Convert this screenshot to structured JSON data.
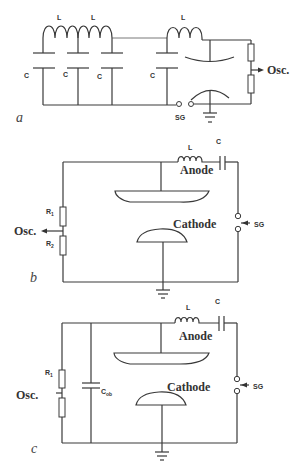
{
  "figure": {
    "panels": [
      {
        "id": "a",
        "label": "a",
        "inductor_labels": [
          "L",
          "L",
          "L"
        ],
        "capacitor_labels": [
          "C",
          "C",
          "C",
          "C"
        ],
        "spark_gap_label": "SG",
        "output_label": "Osc."
      },
      {
        "id": "b",
        "label": "b",
        "inductor_label": "L",
        "capacitor_label": "C",
        "anode_label": "Anode",
        "cathode_label": "Cathode",
        "resistor_labels": [
          "R",
          "R"
        ],
        "resistor_subscripts": [
          "1",
          "2"
        ],
        "spark_gap_label": "SG",
        "output_label": "Osc."
      },
      {
        "id": "c",
        "label": "c",
        "inductor_label": "L",
        "capacitor_label": "C",
        "anode_label": "Anode",
        "cathode_label": "Cathode",
        "resistor_label": "R",
        "resistor_subscript": "1",
        "object_capacitor_label": "C",
        "object_capacitor_subscript": "ob",
        "spark_gap_label": "SG",
        "output_label": "Osc."
      }
    ]
  },
  "colors": {
    "line": "#3a3a3a",
    "text": "#333333",
    "background": "#ffffff"
  }
}
